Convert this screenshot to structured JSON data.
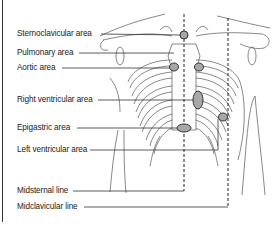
{
  "diagram": {
    "labels": [
      {
        "id": "sternoclavicular",
        "text": "Sternoclavicular area",
        "x": 17,
        "y": 29
      },
      {
        "id": "pulmonary",
        "text": "Pulmonary area",
        "x": 17,
        "y": 48
      },
      {
        "id": "aortic",
        "text": "Aortic area",
        "x": 17,
        "y": 63
      },
      {
        "id": "right-ventricular",
        "text": "Right ventricular area",
        "x": 17,
        "y": 95
      },
      {
        "id": "epigastric",
        "text": "Epigastric area",
        "x": 17,
        "y": 123
      },
      {
        "id": "left-ventricular",
        "text": "Left ventricular area",
        "x": 17,
        "y": 145
      },
      {
        "id": "midsternal-line",
        "text": "Midsternal line",
        "x": 17,
        "y": 186
      },
      {
        "id": "midclavicular-line",
        "text": "Midclavicular line",
        "x": 17,
        "y": 202
      }
    ],
    "colors": {
      "line": "#333333",
      "area_fill": "#a8a8a8",
      "area_stroke": "#333333",
      "anatomy": "#555555"
    }
  }
}
